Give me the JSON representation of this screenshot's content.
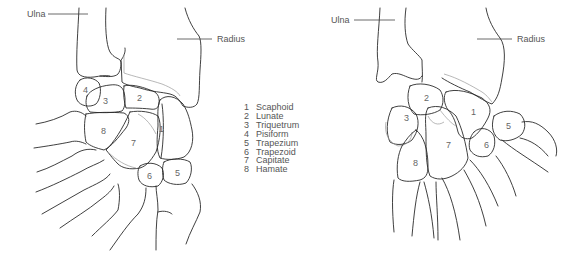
{
  "figure_left": {
    "view": "dorsal",
    "labels": {
      "ulna": "Ulna",
      "radius": "Radius"
    },
    "bone_numbers": [
      "1",
      "2",
      "3",
      "4",
      "5",
      "6",
      "7",
      "8"
    ]
  },
  "figure_right": {
    "view": "palmar",
    "labels": {
      "ulna": "Ulna",
      "radius": "Radius"
    },
    "bone_numbers": [
      "1",
      "2",
      "3",
      "5",
      "6",
      "7",
      "8"
    ]
  },
  "legend": {
    "items": [
      {
        "num": "1",
        "name": "Scaphoid"
      },
      {
        "num": "2",
        "name": "Lunate"
      },
      {
        "num": "3",
        "name": "Triquetrum"
      },
      {
        "num": "4",
        "name": "Pisiform"
      },
      {
        "num": "5",
        "name": "Trapezium"
      },
      {
        "num": "6",
        "name": "Trapezoid"
      },
      {
        "num": "7",
        "name": "Capitate"
      },
      {
        "num": "8",
        "name": "Hamate"
      }
    ]
  }
}
